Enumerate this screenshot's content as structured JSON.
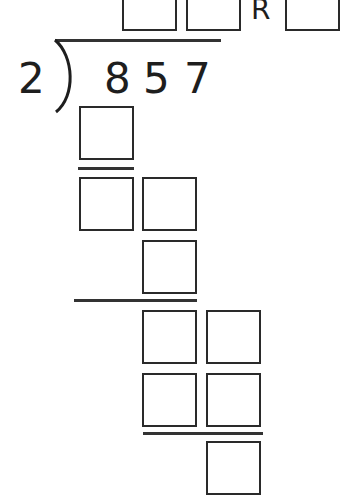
{
  "worksheet": {
    "divisor": "2",
    "dividend_digits": [
      "8",
      "5",
      "7"
    ],
    "remainder_label": "R",
    "quotient_boxes": 2,
    "remainder_boxes": 1,
    "work_rows": [
      {
        "row": 1,
        "boxes": 1
      },
      {
        "row": 2,
        "boxes": 2
      },
      {
        "row": 3,
        "boxes": 1
      },
      {
        "row": 4,
        "boxes": 2
      },
      {
        "row": 5,
        "boxes": 2
      },
      {
        "row": 6,
        "boxes": 1
      }
    ],
    "colors": {
      "ink": "#1e1e1e",
      "background": "#ffffff"
    }
  }
}
